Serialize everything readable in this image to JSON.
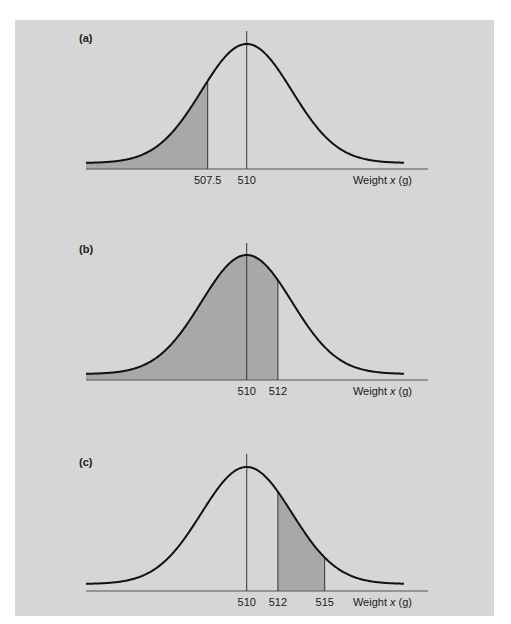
{
  "chart_data": [
    {
      "type": "area",
      "panel_label": "(a)",
      "title": "",
      "xlabel": "Weight x (g)",
      "xlabel_parts": [
        "Weight ",
        "x",
        " (g)"
      ],
      "ylabel": "",
      "distribution": "normal",
      "mean": 510,
      "sd_approx": 2.9,
      "tick_labels": [
        "507.5",
        "510"
      ],
      "ticks": [
        507.5,
        510
      ],
      "shaded_region": {
        "from": null,
        "to": 507.5,
        "description": "x < 507.5"
      },
      "grid": false
    },
    {
      "type": "area",
      "panel_label": "(b)",
      "title": "",
      "xlabel": "Weight x (g)",
      "xlabel_parts": [
        "Weight ",
        "x",
        " (g)"
      ],
      "ylabel": "",
      "distribution": "normal",
      "mean": 510,
      "sd_approx": 2.9,
      "tick_labels": [
        "510",
        "512"
      ],
      "ticks": [
        510,
        512
      ],
      "shaded_region": {
        "from": null,
        "to": 512,
        "description": "x < 512"
      },
      "grid": false
    },
    {
      "type": "area",
      "panel_label": "(c)",
      "title": "",
      "xlabel": "Weight x (g)",
      "xlabel_parts": [
        "Weight ",
        "x",
        " (g)"
      ],
      "ylabel": "",
      "distribution": "normal",
      "mean": 510,
      "sd_approx": 2.9,
      "tick_labels": [
        "510",
        "512",
        "515"
      ],
      "ticks": [
        510,
        512,
        515
      ],
      "shaded_region": {
        "from": 512,
        "to": 515,
        "description": "512 < x < 515"
      },
      "grid": false
    }
  ],
  "colors": {
    "page_background": "#ffffff",
    "panel_background": "#d6d6d6",
    "shaded_area": "#a8a8a8",
    "curve": "#111111",
    "axis": "#555555"
  }
}
